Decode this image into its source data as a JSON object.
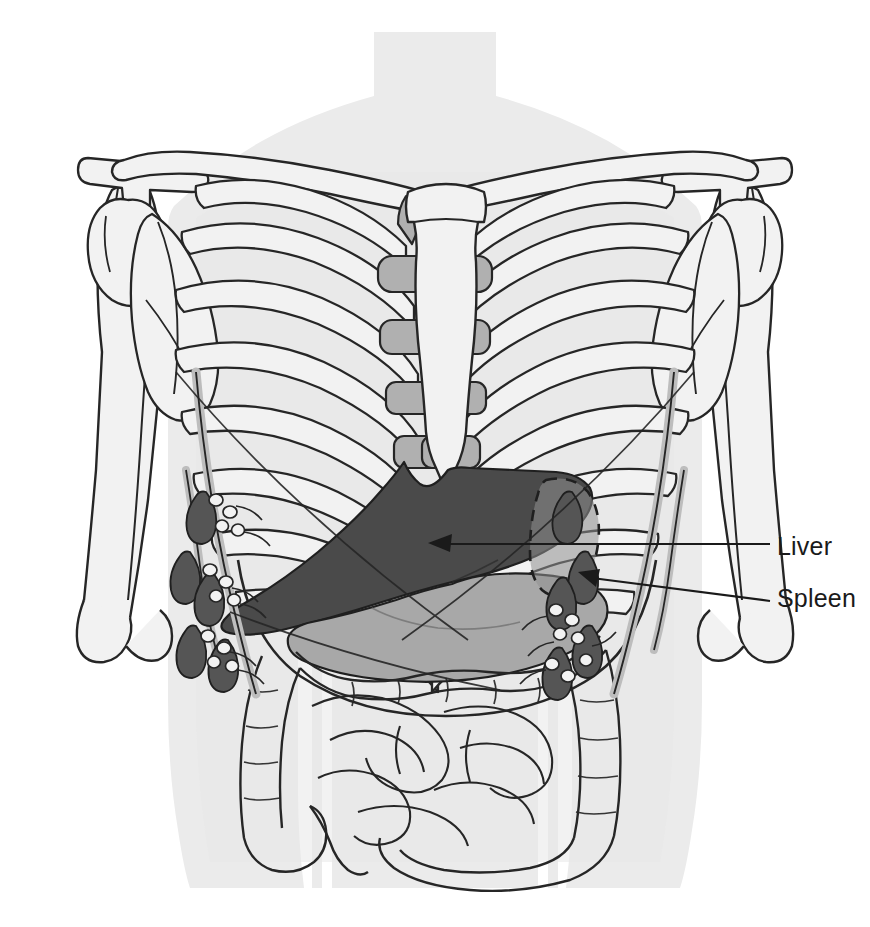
{
  "figure": {
    "type": "anatomical-illustration",
    "background_color": "#ffffff",
    "body_silhouette_color": "#ebebeb",
    "outline_color": "#1a1a1a"
  },
  "labels": [
    {
      "id": "liver",
      "text": "Liver",
      "text_x": 777,
      "text_y": 532,
      "leader_from_x": 770,
      "leader_to_x": 440,
      "leader_y": 544,
      "arrow_tip_x": 428,
      "arrow_tip_y": 543,
      "color": "#1a1a1a"
    },
    {
      "id": "spleen",
      "text": "Spleen",
      "text_x": 777,
      "text_y": 584,
      "leader_from_x": 770,
      "leader_to_x": 590,
      "leader_y": 597,
      "arrow_tip_x": 578,
      "arrow_tip_y": 572,
      "color": "#1a1a1a"
    }
  ],
  "palette": {
    "background": "#ffffff",
    "silhouette": "#ebebeb",
    "bone_fill": "#f2f2f2",
    "cartilage_fill": "#b0b0b0",
    "liver_fill": "#4a4a4a",
    "stomach_fill": "#a8a8a8",
    "lymph_node_fill": "#555555",
    "lymph_vessel_fill": "#bdbdbd",
    "organ_outline": "#1f1f1f",
    "line": "#262626"
  },
  "structures": [
    {
      "name": "body-silhouette",
      "shade": "#ebebeb"
    },
    {
      "name": "clavicle-left",
      "shade": "#f2f2f2"
    },
    {
      "name": "clavicle-right",
      "shade": "#f2f2f2"
    },
    {
      "name": "scapula-left",
      "shade": "#f2f2f2"
    },
    {
      "name": "scapula-right",
      "shade": "#f2f2f2"
    },
    {
      "name": "humerus-left",
      "shade": "#f2f2f2"
    },
    {
      "name": "humerus-right",
      "shade": "#f2f2f2"
    },
    {
      "name": "sternum",
      "shade": "#f2f2f2"
    },
    {
      "name": "xiphoid-process",
      "shade": "#f2f2f2"
    },
    {
      "name": "ribs",
      "shade": "#f2f2f2",
      "pairs": 10
    },
    {
      "name": "costal-cartilage",
      "shade": "#b0b0b0"
    },
    {
      "name": "liver",
      "shade": "#4a4a4a"
    },
    {
      "name": "stomach",
      "shade": "#a8a8a8"
    },
    {
      "name": "spleen",
      "shade": "#8f8f8f",
      "hidden_outline": "dashed"
    },
    {
      "name": "transverse-colon",
      "shade": "none"
    },
    {
      "name": "ascending-colon",
      "shade": "none"
    },
    {
      "name": "descending-colon",
      "shade": "none"
    },
    {
      "name": "sigmoid-colon",
      "shade": "none"
    },
    {
      "name": "cecum",
      "shade": "none"
    },
    {
      "name": "appendix",
      "shade": "none"
    },
    {
      "name": "small-intestine",
      "shade": "none"
    },
    {
      "name": "lymph-nodes-left",
      "shade": "#555555"
    },
    {
      "name": "lymph-nodes-right",
      "shade": "#555555"
    },
    {
      "name": "lymph-vessels",
      "shade": "#bdbdbd"
    }
  ]
}
